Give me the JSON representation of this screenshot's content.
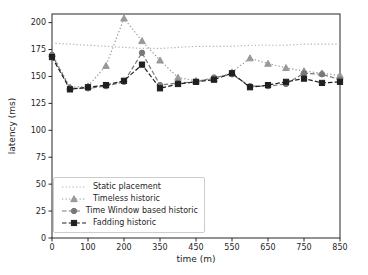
{
  "chart_data": {
    "type": "line",
    "xlabel": "time (m)",
    "ylabel": "latency (ms)",
    "categories": [
      0,
      50,
      100,
      150,
      200,
      250,
      350,
      400,
      450,
      500,
      550,
      600,
      650,
      700,
      750,
      800,
      850
    ],
    "x_tick_indices": [
      0,
      2,
      4,
      6,
      8,
      10,
      12,
      14,
      16
    ],
    "x_tick_labels": [
      "0",
      "100",
      "200",
      "350",
      "450",
      "550",
      "650",
      "750",
      "850"
    ],
    "yticks": [
      0,
      25,
      50,
      75,
      100,
      125,
      150,
      175,
      200
    ],
    "ylim": [
      0,
      208
    ],
    "grid": false,
    "legend_position": "lower-left",
    "axis_color": "#262626",
    "series": [
      {
        "name": "Static placement",
        "linestyle": "dotted",
        "marker": "none",
        "color": "#b3b3b3",
        "values": [
          181,
          180,
          179,
          178,
          177,
          176,
          176,
          177,
          178,
          178,
          178,
          179,
          179,
          179,
          180,
          180,
          180
        ]
      },
      {
        "name": "Timeless historic",
        "linestyle": "dotted",
        "marker": "triangle",
        "color": "#999999",
        "values": [
          171,
          140,
          141,
          160,
          204,
          183,
          165,
          149,
          146,
          148,
          154,
          167,
          162,
          158,
          155,
          153,
          151
        ]
      },
      {
        "name": "Time Window based historic",
        "linestyle": "dashed",
        "marker": "circle",
        "color": "#787878",
        "values": [
          170,
          139,
          139,
          141,
          145,
          172,
          142,
          144,
          145,
          149,
          152,
          141,
          141,
          143,
          153,
          152,
          147
        ]
      },
      {
        "name": "Fadding historic",
        "linestyle": "dashed",
        "marker": "square",
        "color": "#1f1f1f",
        "values": [
          168,
          138,
          140,
          142,
          146,
          161,
          139,
          143,
          145,
          147,
          153,
          140,
          142,
          145,
          148,
          144,
          145
        ]
      }
    ]
  }
}
